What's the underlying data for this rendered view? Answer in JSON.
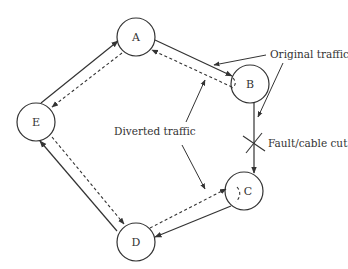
{
  "diagram": {
    "type": "ring-network-protection-switching",
    "colors": {
      "line": "#333333",
      "text": "#333333",
      "background": "#ffffff"
    },
    "nodes": [
      {
        "id": "A",
        "label": "A",
        "cx": 136,
        "cy": 37
      },
      {
        "id": "B",
        "label": "B",
        "cx": 250,
        "cy": 84
      },
      {
        "id": "C",
        "label": "C",
        "cx": 244,
        "cy": 191
      },
      {
        "id": "D",
        "label": "D",
        "cx": 136,
        "cy": 242
      },
      {
        "id": "E",
        "label": "E",
        "cx": 36,
        "cy": 122
      }
    ],
    "node_radius": 19,
    "edges": [
      {
        "from": "A",
        "to": "B",
        "style": "solid",
        "kind": "original"
      },
      {
        "from": "B",
        "to": "C",
        "style": "solid",
        "kind": "original",
        "fault": true
      },
      {
        "from": "C",
        "to": "D",
        "style": "solid",
        "kind": "original"
      },
      {
        "from": "D",
        "to": "E",
        "style": "solid",
        "kind": "original"
      },
      {
        "from": "E",
        "to": "A",
        "style": "solid",
        "kind": "original"
      },
      {
        "from": "B",
        "to": "A",
        "style": "dashed",
        "kind": "diverted"
      },
      {
        "from": "A",
        "to": "E",
        "style": "dashed",
        "kind": "diverted"
      },
      {
        "from": "E",
        "to": "D",
        "style": "dashed",
        "kind": "diverted"
      },
      {
        "from": "D",
        "to": "C",
        "style": "dashed",
        "kind": "diverted"
      }
    ],
    "annotations": {
      "original_traffic": "Original traffic",
      "diverted_traffic": "Diverted traffic",
      "fault": "Fault/cable cut"
    }
  }
}
